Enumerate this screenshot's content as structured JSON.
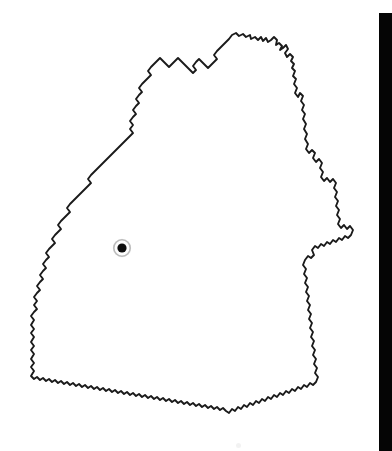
{
  "page": {
    "background_color": "#ffffff",
    "width": 392,
    "height": 451,
    "kind": "scanned-outline-map"
  },
  "map": {
    "title": "Baden-Württemberg outline map",
    "region_name": "Baden-Württemberg",
    "outline_color": "#1a1a1a",
    "fill_color": "#ffffff",
    "stroke_width": 1.9,
    "labels": [],
    "legend": [],
    "scale_bar": null,
    "north_arrow": null
  },
  "markers": [
    {
      "name": "location-marker",
      "label": "",
      "x": 122,
      "y": 248,
      "dot_radius": 4.6,
      "halo_radius": 8.2,
      "dot_color": "#0d0d0d",
      "halo_color": "#b9b9b9"
    }
  ],
  "edge_bar": {
    "name": "page-edge-bar",
    "color": "#050505",
    "x": 379,
    "y": 13,
    "width": 13,
    "height": 438
  },
  "artifacts": [
    {
      "name": "scan-speck",
      "x": 236,
      "y": 443,
      "size": 5
    }
  ]
}
